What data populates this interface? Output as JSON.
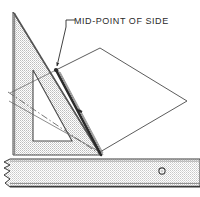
{
  "figure": {
    "title_visible": false,
    "annotation": {
      "text": "MID-POINT OF SIDE",
      "leader_from": [
        78,
        26
      ],
      "leader_elbow": [
        66,
        20
      ],
      "arrow_tip": [
        56,
        70
      ]
    },
    "colors": {
      "outline": "#3a3a3a",
      "heavy_edge": "#2a2a2a",
      "set_square_fill": "#e2e2e2",
      "paper_fill": "#ffffff",
      "ruler_fill": "#e6e6e6",
      "construction_line": "#555555",
      "background": "#ffffff"
    },
    "objects": [
      {
        "name": "set-square",
        "kind": "right-triangle-template",
        "description": "45-degree set square standing on the straightedge, shaded grey, with a triangular cut-out window",
        "outer_points": "13,12 13,155 101,155",
        "inner_cutout_points": "33,70 33,141 72,141"
      },
      {
        "name": "paper-sheet",
        "kind": "quadrilateral",
        "description": "White sheet of paper seen in perspective, folded up against the set square",
        "points": "100,48 187,101 100,152 56,70"
      },
      {
        "name": "fold-edge",
        "kind": "heavy-line",
        "description": "Thick edge where the sheet meets the set square hypotenuse",
        "from": [
          56,
          70
        ],
        "to": [
          101,
          155
        ]
      },
      {
        "name": "straightedge",
        "kind": "ruler",
        "description": "Horizontal ruler / T-square blade across the bottom with a hanging hole and a torn break symbol at the left end",
        "top": 159,
        "bottom": 187,
        "left": 4,
        "right": 196,
        "hole": {
          "cx": 162,
          "cy": 171,
          "r": 3
        }
      }
    ],
    "construction_lines": [
      {
        "name": "dashed-diagonal-upper",
        "from": [
          8,
          92
        ],
        "to": [
          101,
          155
        ],
        "style": "dash-dot"
      },
      {
        "name": "thin-diagonal-lower",
        "from": [
          9,
          101
        ],
        "to": [
          100,
          152
        ],
        "style": "solid-thin"
      },
      {
        "name": "thin-diagonal-to-apex",
        "from": [
          10,
          93
        ],
        "to": [
          56,
          70
        ],
        "style": "solid-thin"
      }
    ]
  }
}
